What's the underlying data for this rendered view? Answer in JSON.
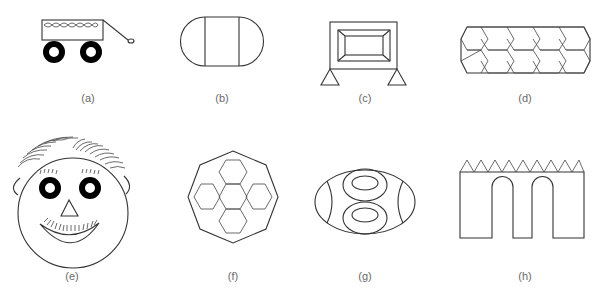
{
  "figure": {
    "panels": [
      {
        "id": "a",
        "label": "(a)",
        "subject": "wagon with handle and two wheels"
      },
      {
        "id": "b",
        "label": "(b)",
        "subject": "rounded rectangle divided by two vertical lines"
      },
      {
        "id": "c",
        "label": "(c)",
        "subject": "framed beveled rectangle on two triangular supports"
      },
      {
        "id": "d",
        "label": "(d)",
        "subject": "band of overlapping hexagons"
      },
      {
        "id": "e",
        "label": "(e)",
        "subject": "smiling face with hair, ears, eyes, triangle nose, mustache"
      },
      {
        "id": "f",
        "label": "(f)",
        "subject": "octagon containing cross of five hexagons"
      },
      {
        "id": "g",
        "label": "(g)",
        "subject": "ellipse with figure-eight of two nested ovals and side arcs"
      },
      {
        "id": "h",
        "label": "(h)",
        "subject": "wall with triangular crenellations and two arches"
      }
    ],
    "colors": {
      "stroke": "#333333",
      "fill": "#000000",
      "label": "#6a6a6a",
      "background": "#ffffff"
    }
  }
}
